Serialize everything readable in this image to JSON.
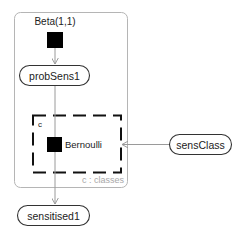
{
  "diagram": {
    "type": "factor-graph",
    "nodes": {
      "beta_factor": {
        "label": "Beta(1,1)",
        "kind": "factor"
      },
      "prob_sens": {
        "label": "probSens1",
        "kind": "variable"
      },
      "bernoulli_factor": {
        "label": "Bernoulli",
        "kind": "factor"
      },
      "sens_class": {
        "label": "sensClass",
        "kind": "variable"
      },
      "sensitised": {
        "label": "sensitised1",
        "kind": "variable"
      }
    },
    "plates": {
      "outer": {
        "label": "c : classes"
      },
      "inner": {
        "label": "c"
      }
    },
    "edges": [
      {
        "from": "Beta(1,1)",
        "to": "probSens1"
      },
      {
        "from": "probSens1",
        "to": "Bernoulli"
      },
      {
        "from": "sensClass",
        "to": "Bernoulli"
      },
      {
        "from": "Bernoulli",
        "to": "sensitised1"
      }
    ],
    "colors": {
      "edge": "#9a9a9a",
      "plate_outer": "#b5b5b5",
      "plate_inner": "#111111",
      "factor_fill": "#000000",
      "node_stroke": "#333333",
      "plate_label": "#a8a8a8"
    }
  }
}
